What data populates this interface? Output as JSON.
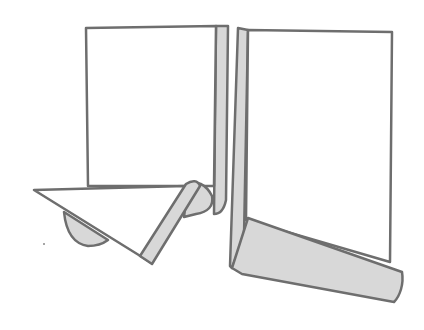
{
  "illustration": {
    "subject": "two folded paper panels",
    "colors": {
      "background": "#ffffff",
      "paper": "#ffffff",
      "shade": "#d8d8d8",
      "outline": "#6e6e6e"
    }
  }
}
